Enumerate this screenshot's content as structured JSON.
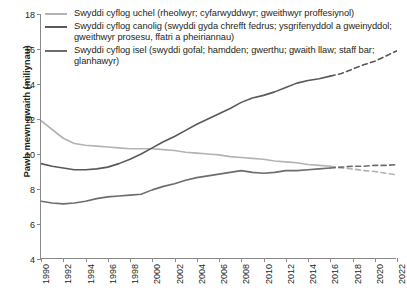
{
  "chart_data": {
    "type": "line",
    "title": "",
    "xlabel": "",
    "ylabel": "Pawb mewn gwaith (miliynau)",
    "xlim": [
      1990,
      2022
    ],
    "ylim": [
      4,
      18
    ],
    "grid": false,
    "legend_position": "top-left",
    "x_ticks": [
      "1990",
      "1992",
      "1994",
      "1996",
      "1998",
      "2000",
      "2002",
      "2004",
      "2006",
      "2008",
      "2010",
      "2012",
      "2014",
      "2016",
      "2018",
      "2020",
      "2022"
    ],
    "y_ticks": [
      "4",
      "6",
      "8",
      "10",
      "12",
      "14",
      "16",
      "18"
    ],
    "x": [
      1990,
      1991,
      1992,
      1993,
      1994,
      1995,
      1996,
      1997,
      1998,
      1999,
      2000,
      2001,
      2002,
      2003,
      2004,
      2005,
      2006,
      2007,
      2008,
      2009,
      2010,
      2011,
      2012,
      2013,
      2014,
      2015,
      2016,
      2017,
      2018,
      2019,
      2020,
      2021,
      2022
    ],
    "forecast_start_year": 2016,
    "series": [
      {
        "name": "Swyddi cyflog uchel (rheolwyr; cyfarwyddwyr; gweithwyr proffesiynol)",
        "short_name": "high-paid-jobs",
        "color": "#b3b3b3",
        "values": [
          11.9,
          11.4,
          10.9,
          10.6,
          10.5,
          10.45,
          10.4,
          10.35,
          10.3,
          10.3,
          10.3,
          10.25,
          10.2,
          10.1,
          10.05,
          10.0,
          9.95,
          9.85,
          9.8,
          9.75,
          9.7,
          9.6,
          9.55,
          9.5,
          9.4,
          9.35,
          9.3,
          9.2,
          9.15,
          9.05,
          9.0,
          8.9,
          8.8
        ],
        "projection": [
          9.3,
          9.2,
          9.15,
          9.05,
          9.0,
          8.9,
          8.8
        ]
      },
      {
        "name": "Swyddi cyflog canolig (swyddi gyda chrefft fedrus; ysgrifenyddol a gweinyddol; gweithwyr prosesu, ffatri a pheiriannau)",
        "short_name": "mid-paid-jobs",
        "color": "#595959",
        "values": [
          9.45,
          9.3,
          9.2,
          9.1,
          9.1,
          9.15,
          9.25,
          9.45,
          9.7,
          10.0,
          10.35,
          10.7,
          11.0,
          11.35,
          11.7,
          12.0,
          12.3,
          12.6,
          12.95,
          13.2,
          13.35,
          13.55,
          13.8,
          14.05,
          14.2,
          14.3,
          14.45,
          14.6,
          14.85,
          15.1,
          15.3,
          15.6,
          15.9
        ],
        "projection": [
          14.45,
          14.6,
          14.85,
          15.1,
          15.3,
          15.6,
          15.9
        ]
      },
      {
        "name": "Swyddi cyflog isel (swyddi gofal; hamdden; gwerthu; gwaith llaw; staff bar; glanhawyr)",
        "short_name": "low-paid-jobs",
        "color": "#6d6d6d",
        "values": [
          7.3,
          7.2,
          7.15,
          7.2,
          7.3,
          7.45,
          7.55,
          7.6,
          7.65,
          7.7,
          7.95,
          8.15,
          8.3,
          8.5,
          8.65,
          8.75,
          8.85,
          8.95,
          9.05,
          8.95,
          8.9,
          8.95,
          9.05,
          9.05,
          9.1,
          9.15,
          9.2,
          9.25,
          9.3,
          9.3,
          9.35,
          9.35,
          9.4
        ],
        "projection": [
          9.2,
          9.25,
          9.3,
          9.3,
          9.35,
          9.35,
          9.4
        ]
      }
    ]
  },
  "legend": {
    "items": [
      {
        "label": "Swyddi cyflog uchel (rheolwyr; cyfarwyddwyr; gweithwyr proffesiynol)",
        "color": "#b3b3b3"
      },
      {
        "label": "Swyddi cyflog canolig (swyddi gyda chrefft fedrus; ysgrifenyddol a gweinyddol; gweithwyr prosesu, ffatri a pheiriannau)",
        "color": "#595959"
      },
      {
        "label": "Swyddi cyflog isel (swyddi gofal; hamdden; gwerthu; gwaith llaw; staff bar; glanhawyr)",
        "color": "#6d6d6d"
      }
    ]
  },
  "axes": {
    "y_title": "Pawb mewn gwaith (miliynau)"
  }
}
